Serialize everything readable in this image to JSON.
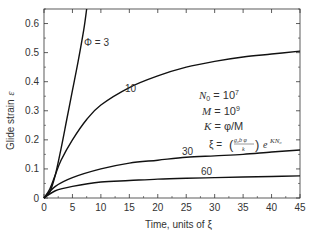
{
  "chart_data": {
    "type": "line",
    "title": "",
    "xlabel": "Time, units of ξ",
    "ylabel": "Glide strain ε",
    "xlim": [
      0,
      45
    ],
    "ylim": [
      0,
      0.65
    ],
    "xticks": [
      0,
      5,
      10,
      15,
      20,
      25,
      30,
      35,
      40,
      45
    ],
    "yticks": [
      0,
      0.1,
      0.2,
      0.3,
      0.4,
      0.5,
      0.6
    ],
    "ytick_labels": [
      "0",
      "0.1",
      "0.2",
      "0.3",
      "0.4",
      "0.5",
      "0.6"
    ],
    "grid": false,
    "legend": "inline curve labels",
    "series": [
      {
        "name": "Φ = 3",
        "label": "Φ = 3",
        "x": [
          0,
          1,
          2,
          3,
          4,
          5,
          6,
          7,
          7.5
        ],
        "y": [
          0,
          0.02,
          0.08,
          0.17,
          0.27,
          0.37,
          0.47,
          0.58,
          0.65
        ]
      },
      {
        "name": "10",
        "label": "10",
        "x": [
          0,
          1,
          2,
          3,
          5,
          7.5,
          10,
          15,
          20,
          25,
          30,
          35,
          40,
          45
        ],
        "y": [
          0,
          0.03,
          0.08,
          0.13,
          0.2,
          0.27,
          0.32,
          0.38,
          0.42,
          0.45,
          0.47,
          0.485,
          0.495,
          0.505
        ]
      },
      {
        "name": "30",
        "label": "30",
        "x": [
          0,
          2,
          5,
          10,
          15,
          20,
          25,
          30,
          35,
          40,
          45
        ],
        "y": [
          0,
          0.04,
          0.07,
          0.1,
          0.12,
          0.13,
          0.14,
          0.145,
          0.15,
          0.158,
          0.165
        ]
      },
      {
        "name": "60",
        "label": "60",
        "x": [
          0,
          2,
          5,
          10,
          15,
          20,
          25,
          30,
          35,
          40,
          45
        ],
        "y": [
          0,
          0.025,
          0.04,
          0.055,
          0.06,
          0.065,
          0.068,
          0.07,
          0.072,
          0.074,
          0.076
        ]
      }
    ],
    "annotations": [
      "N₀ = 10⁷",
      "M = 10⁹",
      "K = φ/M",
      "ξ = (g₀b φ / k) e^{K N₀}"
    ]
  },
  "labels": {
    "phi3": "Φ = 3",
    "c10": "10",
    "c30": "30",
    "c60": "60",
    "ylabel": "Glide strain",
    "ylabel_sym": "ε",
    "xlabel": "Time, units of ξ",
    "ann_n0": "N",
    "ann_n0_sub": "0",
    "ann_n0_val": " = 10",
    "ann_n0_exp": "7",
    "ann_m": "M",
    "ann_m_val": " = 10",
    "ann_m_exp": "9",
    "ann_k": "K",
    "ann_k_val": " = φ/M",
    "ann_xi": "ξ = ",
    "ann_frac_num": "g₀b φ",
    "ann_frac_den": "k",
    "ann_e": "e",
    "ann_exp": "KN₀"
  },
  "ticks": {
    "x": [
      "0",
      "5",
      "10",
      "15",
      "20",
      "25",
      "30",
      "35",
      "40",
      "45"
    ],
    "y": [
      "0",
      "0.1",
      "0.2",
      "0.3",
      "0.4",
      "0.5",
      "0.6"
    ]
  }
}
